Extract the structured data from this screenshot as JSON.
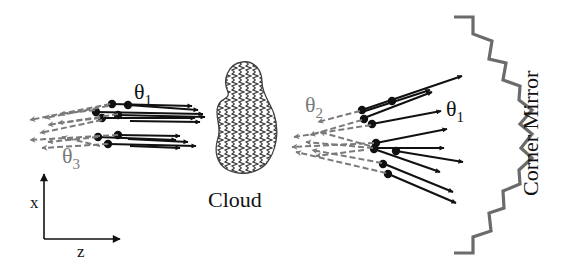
{
  "diagram": {
    "colors": {
      "incident": "#111111",
      "reflected": "#777777",
      "mirror": "#6b6b6b",
      "cloud_outline": "#444444",
      "cloud_hatch": "#333333"
    },
    "labels": {
      "theta1_left": "θ",
      "theta1_left_sub": "1",
      "theta3": "θ",
      "theta3_sub": "3",
      "theta2": "θ",
      "theta2_sub": "2",
      "theta1_right": "θ",
      "theta1_right_sub": "1",
      "cloud": "Cloud",
      "mirror": "Corner Mirror",
      "axis_x": "x",
      "axis_z": "z"
    },
    "components": [
      {
        "name": "incident-beam-bundle",
        "description": "Parallel solid black arrows with dot origins, divergence θ1, heading +z toward cloud"
      },
      {
        "name": "return-beam-bundle-left",
        "description": "Dashed gray arrows heading -z, divergence θ3"
      },
      {
        "name": "cloud",
        "description": "Irregular blob filled with vertical zigzag hatching"
      },
      {
        "name": "scattered-beam-fan",
        "description": "Solid black arrows fanning out after the cloud, divergence θ1"
      },
      {
        "name": "scattered-return-fan",
        "description": "Dashed gray arrows heading back toward the cloud, divergence θ2"
      },
      {
        "name": "corner-mirror",
        "description": "Concave stepped (staircase) retroreflecting mirror"
      },
      {
        "name": "coordinate-axes",
        "description": "x vertical, z horizontal"
      }
    ]
  }
}
